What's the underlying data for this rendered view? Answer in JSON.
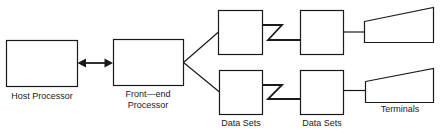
{
  "diagram": {
    "nodes": {
      "host": {
        "label": "Host Processor"
      },
      "frontend": {
        "label_line1": "Front—end",
        "label_line2": "Processor"
      },
      "datasets_local": {
        "label": "Data Sets"
      },
      "datasets_remote": {
        "label": "Data Sets"
      },
      "terminals": {
        "label": "Terminals"
      }
    },
    "edges": [
      {
        "from": "host",
        "to": "frontend",
        "type": "bidirectional-arrow"
      },
      {
        "from": "frontend",
        "to": "datasets_local_top",
        "type": "line"
      },
      {
        "from": "frontend",
        "to": "datasets_local_bottom",
        "type": "line"
      },
      {
        "from": "datasets_local_top",
        "to": "datasets_remote_top",
        "type": "communication-link"
      },
      {
        "from": "datasets_local_bottom",
        "to": "datasets_remote_bottom",
        "type": "communication-link"
      },
      {
        "from": "datasets_remote_top",
        "to": "terminal_top",
        "type": "line"
      },
      {
        "from": "datasets_remote_bottom",
        "to": "terminal_bottom",
        "type": "line"
      }
    ],
    "colors": {
      "stroke": "#1a1a1a",
      "background": "#ffffff"
    }
  }
}
